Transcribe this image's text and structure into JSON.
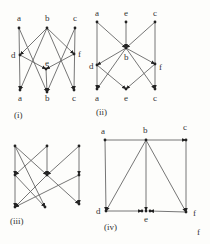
{
  "colors": {
    "edge": "#666666",
    "text": "#333333",
    "node": "#222222",
    "background": "#fdfdfb"
  },
  "diagrams": [
    {
      "caption": "(i)",
      "caption_pos": [
        14,
        118
      ],
      "nodes": [
        {
          "id": "a_top",
          "label": "a",
          "x": 19,
          "y": 28,
          "lx": 17,
          "ly": 21
        },
        {
          "id": "b_top",
          "label": "b",
          "x": 47,
          "y": 28,
          "lx": 45,
          "ly": 21
        },
        {
          "id": "c_top",
          "label": "c",
          "x": 75,
          "y": 28,
          "lx": 73,
          "ly": 21
        },
        {
          "id": "d",
          "label": "d",
          "x": 20,
          "y": 55,
          "lx": 11,
          "ly": 58
        },
        {
          "id": "e",
          "label": "e",
          "x": 46,
          "y": 69,
          "lx": 45,
          "ly": 66
        },
        {
          "id": "f",
          "label": "f",
          "x": 74,
          "y": 54,
          "lx": 78,
          "ly": 57
        },
        {
          "id": "a_bot",
          "label": "a",
          "x": 20,
          "y": 90,
          "lx": 18,
          "ly": 101
        },
        {
          "id": "b_bot",
          "label": "b",
          "x": 47,
          "y": 92,
          "lx": 45,
          "ly": 101
        },
        {
          "id": "c_bot",
          "label": "c",
          "x": 74,
          "y": 90,
          "lx": 72,
          "ly": 101
        }
      ],
      "edges": [
        [
          "a_top",
          "a_bot"
        ],
        [
          "a_top",
          "b_bot"
        ],
        [
          "b_top",
          "d"
        ],
        [
          "b_top",
          "f"
        ],
        [
          "b_top",
          "a_bot"
        ],
        [
          "b_top",
          "c_bot"
        ],
        [
          "c_top",
          "c_bot"
        ],
        [
          "c_top",
          "b_bot"
        ],
        [
          "d",
          "e"
        ],
        [
          "f",
          "e"
        ],
        [
          "e",
          "b_bot"
        ]
      ]
    },
    {
      "caption": "(ii)",
      "caption_pos": [
        96,
        115
      ],
      "nodes": [
        {
          "id": "a_top",
          "label": "a",
          "x": 97,
          "y": 22,
          "lx": 95,
          "ly": 16
        },
        {
          "id": "e_top",
          "label": "e",
          "x": 126,
          "y": 22,
          "lx": 124,
          "ly": 16
        },
        {
          "id": "c_top",
          "label": "c",
          "x": 155,
          "y": 22,
          "lx": 153,
          "ly": 16
        },
        {
          "id": "b",
          "label": "b",
          "x": 126,
          "y": 48,
          "lx": 124,
          "ly": 60
        },
        {
          "id": "d",
          "label": "d",
          "x": 97,
          "y": 65,
          "lx": 89,
          "ly": 69
        },
        {
          "id": "f",
          "label": "f",
          "x": 155,
          "y": 64,
          "lx": 159,
          "ly": 70
        },
        {
          "id": "a_bot",
          "label": "a",
          "x": 97,
          "y": 89,
          "lx": 95,
          "ly": 101
        },
        {
          "id": "e_bot",
          "label": "e",
          "x": 126,
          "y": 89,
          "lx": 124,
          "ly": 101
        },
        {
          "id": "c_bot",
          "label": "c",
          "x": 155,
          "y": 89,
          "lx": 153,
          "ly": 101
        }
      ],
      "edges": [
        [
          "a_top",
          "b"
        ],
        [
          "e_top",
          "b"
        ],
        [
          "c_top",
          "b"
        ],
        [
          "a_top",
          "a_bot"
        ],
        [
          "c_top",
          "c_bot"
        ],
        [
          "b",
          "d"
        ],
        [
          "b",
          "f"
        ],
        [
          "b",
          "a_bot"
        ],
        [
          "b",
          "c_bot"
        ],
        [
          "d",
          "e_bot"
        ],
        [
          "f",
          "e_bot"
        ]
      ]
    },
    {
      "caption": "(iii)",
      "caption_pos": [
        10,
        224
      ],
      "nodes": [
        {
          "id": "t1",
          "label": "",
          "x": 15,
          "y": 146
        },
        {
          "id": "t2",
          "label": "",
          "x": 47,
          "y": 146
        },
        {
          "id": "t3",
          "label": "",
          "x": 79,
          "y": 146
        },
        {
          "id": "m1",
          "label": "",
          "x": 15,
          "y": 175
        },
        {
          "id": "m2",
          "label": "",
          "x": 47,
          "y": 175
        },
        {
          "id": "m3",
          "label": "",
          "x": 79,
          "y": 175
        },
        {
          "id": "b1",
          "label": "",
          "x": 15,
          "y": 207
        },
        {
          "id": "b2",
          "label": "",
          "x": 45,
          "y": 207
        },
        {
          "id": "b3",
          "label": "",
          "x": 79,
          "y": 204
        }
      ],
      "edges": [
        [
          "t1",
          "m1"
        ],
        [
          "t1",
          "m2"
        ],
        [
          "t1",
          "b2"
        ],
        [
          "t2",
          "m1"
        ],
        [
          "t2",
          "m2"
        ],
        [
          "t3",
          "m2"
        ],
        [
          "t3",
          "m3"
        ],
        [
          "m1",
          "b1"
        ],
        [
          "m1",
          "b2"
        ],
        [
          "m2",
          "b1"
        ],
        [
          "m2",
          "b3"
        ],
        [
          "m3",
          "b1"
        ],
        [
          "m3",
          "b3"
        ]
      ]
    },
    {
      "caption": "(iv)",
      "caption_pos": [
        104,
        230
      ],
      "extra_label": {
        "text": "f",
        "x": 197,
        "y": 235
      },
      "nodes": [
        {
          "id": "a",
          "label": "a",
          "x": 105,
          "y": 140,
          "lx": 101,
          "ly": 134
        },
        {
          "id": "b",
          "label": "b",
          "x": 146,
          "y": 140,
          "lx": 143,
          "ly": 133
        },
        {
          "id": "c",
          "label": "c",
          "x": 186,
          "y": 140,
          "lx": 183,
          "ly": 130
        },
        {
          "id": "d",
          "label": "d",
          "x": 106,
          "y": 211,
          "lx": 96,
          "ly": 214
        },
        {
          "id": "e1",
          "label": "",
          "x": 142,
          "y": 211
        },
        {
          "id": "e2",
          "label": "e",
          "x": 146,
          "y": 211,
          "lx": 144,
          "ly": 222
        },
        {
          "id": "e3",
          "label": "",
          "x": 150,
          "y": 211
        },
        {
          "id": "f",
          "label": "f",
          "x": 186,
          "y": 212,
          "lx": 193,
          "ly": 216
        }
      ],
      "edges": [
        [
          "a",
          "c"
        ],
        [
          "a",
          "d"
        ],
        [
          "c",
          "f"
        ],
        [
          "b",
          "d"
        ],
        [
          "b",
          "f"
        ],
        [
          "b",
          "e2"
        ],
        [
          "d",
          "e1"
        ],
        [
          "f",
          "e3"
        ]
      ]
    }
  ]
}
